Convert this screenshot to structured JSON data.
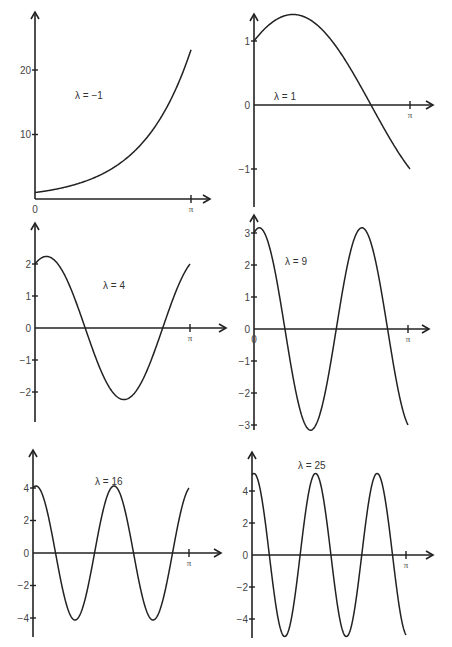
{
  "chart_data": [
    {
      "type": "line",
      "title": "λ = −1",
      "label": "λ  =  −1",
      "function": "y = e^x",
      "x_range": [
        0,
        3.14159
      ],
      "xticks": [
        "0",
        "π"
      ],
      "yticks": [
        "10",
        "20"
      ],
      "ytick_values": [
        10,
        20
      ],
      "ylim": [
        0,
        23.1
      ],
      "series": [
        {
          "name": "λ = −1",
          "x": [
            0,
            0.785,
            1.571,
            2.356,
            3.142
          ],
          "y": [
            1,
            2.19,
            4.81,
            10.55,
            23.14
          ]
        }
      ]
    },
    {
      "type": "line",
      "title": "λ = 1",
      "label": "λ  =  1",
      "function": "y = cos x + sin x",
      "x_range": [
        0,
        3.14159
      ],
      "xticks": [
        "0",
        "π"
      ],
      "yticks": [
        "1",
        "0",
        "−1"
      ],
      "ytick_values": [
        1,
        0,
        -1
      ],
      "ylim": [
        -1.5,
        1.5
      ],
      "series": [
        {
          "name": "λ = 1",
          "x": [
            0,
            0.785,
            1.571,
            2.356,
            3.142
          ],
          "y": [
            1,
            1.414,
            1,
            0,
            -1
          ]
        }
      ]
    },
    {
      "type": "line",
      "title": "λ = 4",
      "label": "λ  =  4",
      "function": "y = 2cos 2x + sin 2x",
      "x_range": [
        0,
        3.14159
      ],
      "xticks": [
        "0",
        "π"
      ],
      "yticks": [
        "2",
        "1",
        "0",
        "−1",
        "−2"
      ],
      "ytick_values": [
        2,
        1,
        0,
        -1,
        -2
      ],
      "ylim": [
        -2.8,
        2.8
      ],
      "series": [
        {
          "name": "λ = 4",
          "amplitude": 2.236,
          "y0": 2,
          "y_pi": 2
        }
      ]
    },
    {
      "type": "line",
      "title": "λ = 9",
      "label": "λ  =  9",
      "function": "y = 3cos 3x + sin 3x",
      "x_range": [
        0,
        3.14159
      ],
      "xticks": [
        "0",
        "π"
      ],
      "yticks": [
        "3",
        "2",
        "1",
        "0",
        "−1",
        "−2",
        "−3"
      ],
      "ytick_values": [
        3,
        2,
        1,
        0,
        -1,
        -2,
        -3
      ],
      "ylim": [
        -3.2,
        3.3
      ],
      "series": [
        {
          "name": "λ = 9",
          "amplitude": 3.162,
          "y0": 3,
          "y_pi": -3
        }
      ]
    },
    {
      "type": "line",
      "title": "λ = 16",
      "label": "λ  =  16",
      "function": "y = 4cos 4x + sin 4x",
      "x_range": [
        0,
        3.14159
      ],
      "xticks": [
        "0",
        "π"
      ],
      "yticks": [
        "4",
        "2",
        "0",
        "−2",
        "−4"
      ],
      "ytick_values": [
        4,
        2,
        0,
        -2,
        -4
      ],
      "ylim": [
        -5,
        6
      ],
      "series": [
        {
          "name": "λ = 16",
          "amplitude": 4.123,
          "y0": 4,
          "y_pi": 4
        }
      ]
    },
    {
      "type": "line",
      "title": "λ = 25",
      "label": "λ  =  25",
      "function": "y = 5cos 5x + sin 5x",
      "x_range": [
        0,
        3.14159
      ],
      "xticks": [
        "0",
        "π"
      ],
      "yticks": [
        "4",
        "2",
        "0",
        "−2",
        "−4"
      ],
      "ytick_values": [
        4,
        2,
        0,
        -2,
        -4
      ],
      "ylim": [
        -5,
        6
      ],
      "series": [
        {
          "name": "λ = 25",
          "amplitude": 5.099,
          "y0": 5,
          "y_pi": -5
        }
      ]
    }
  ],
  "lambdas": [
    -1,
    1,
    4,
    9,
    16,
    25
  ],
  "pi_label": "π",
  "zero_label": "0"
}
